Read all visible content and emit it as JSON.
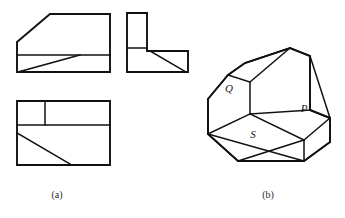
{
  "figure": {
    "background_color": "#ffffff",
    "line_color": "#111111",
    "label_color": "#1a1a1a",
    "width": 345,
    "height": 218
  },
  "captions": [
    {
      "key": "a",
      "text": "(a)",
      "x": 57,
      "y": 198
    },
    {
      "key": "b",
      "text": "(b)",
      "x": 268,
      "y": 198
    }
  ],
  "part_a": {
    "name": "orthographic-views",
    "views": [
      {
        "name": "front-view",
        "description": "Rectangle with chamfered top-left corner, horizontal division line and a diagonal line in the lower band",
        "outline": "M17,42 L50,14 L110,14 L110,72 L17,72 Z",
        "internal_lines": [
          "M17,55 L110,55",
          "M18,72 L80,55"
        ]
      },
      {
        "name": "side-view",
        "description": "L-shaped profile with a diagonal line across the lower horizontal leg",
        "outline": "M127,13 L147,13 L147,51 L188,51 L188,72 L127,72 Z",
        "internal_lines": [
          "M127,48 L147,48",
          "M150,51 L186,72"
        ]
      },
      {
        "name": "top-view",
        "description": "Rectangle with a horizontal band divided by a vertical line, and a diagonal line in the lower region",
        "outline": "M17,101 L110,101 L110,165 L17,165 Z",
        "internal_lines": [
          "M17,125 L110,125",
          "M45,101 L45,125",
          "M17,133 L70,164"
        ]
      }
    ]
  },
  "part_b": {
    "name": "isometric-view",
    "description": "Pictorial isometric drawing of the block with three labelled faces",
    "faces": [
      {
        "label": "Q",
        "x": 229,
        "y": 92,
        "name": "face-q"
      },
      {
        "label": "P",
        "x": 304,
        "y": 112,
        "name": "face-p"
      },
      {
        "label": "S",
        "x": 253,
        "y": 138,
        "name": "face-s"
      }
    ],
    "outline": "M208,99 L208,134 L238,161 L304,161 L330,142 L330,118 L310,110 L310,56 L290,48 L245,63 L228,75 Z",
    "edges": [
      "M208,99 L228,75 L245,63 L290,48 L310,56 L310,110",
      "M208,99 L208,134 L238,161 L304,161 L330,142 L330,118",
      "M228,75 L250,82 L250,114",
      "M250,82 L290,48",
      "M250,114 L310,110",
      "M310,56 L330,118",
      "M310,110 L330,118",
      "M208,134 L250,114",
      "M208,134 L304,161",
      "M250,114 L304,140 L304,161",
      "M304,140 L330,118",
      "M238,161 L304,140"
    ]
  }
}
